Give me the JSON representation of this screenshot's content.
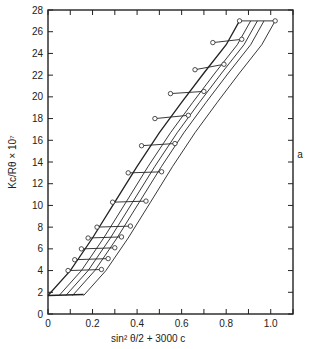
{
  "chart_data": {
    "type": "line",
    "title": "",
    "subtitle": "Zimm plot",
    "xlabel": "sin² θ/2 + 3000 c",
    "ylabel": "Kc/Rθ × 10⁷",
    "xlim": [
      0,
      1.1
    ],
    "ylim": [
      0,
      28
    ],
    "x_ticks": [
      "0",
      "0.2",
      "0.4",
      "0.6",
      "0.8",
      "1.0"
    ],
    "y_ticks": [
      "0",
      "2",
      "4",
      "6",
      "8",
      "10",
      "12",
      "14",
      "16",
      "18",
      "20",
      "22",
      "24",
      "26",
      "28"
    ],
    "grid": false,
    "legend": null,
    "constant_concentration_series": [
      {
        "name": "c=0 (extrapolated)",
        "points": [
          [
            0.0,
            1.7
          ],
          [
            0.1,
            4.0
          ],
          [
            0.2,
            7.0
          ],
          [
            0.3,
            10.3
          ],
          [
            0.4,
            13.6
          ],
          [
            0.5,
            16.7
          ],
          [
            0.6,
            19.5
          ],
          [
            0.7,
            22.2
          ],
          [
            0.8,
            24.8
          ],
          [
            0.86,
            27.0
          ]
        ]
      },
      {
        "name": "c1",
        "points": [
          [
            0.05,
            1.7
          ],
          [
            0.15,
            4.0
          ],
          [
            0.25,
            7.0
          ],
          [
            0.35,
            10.3
          ],
          [
            0.45,
            13.6
          ],
          [
            0.55,
            16.7
          ],
          [
            0.65,
            19.5
          ],
          [
            0.75,
            22.2
          ],
          [
            0.85,
            24.8
          ],
          [
            0.91,
            27.0
          ]
        ]
      },
      {
        "name": "c2",
        "points": [
          [
            0.08,
            1.7
          ],
          [
            0.18,
            4.0
          ],
          [
            0.28,
            7.0
          ],
          [
            0.38,
            10.3
          ],
          [
            0.48,
            13.6
          ],
          [
            0.58,
            16.7
          ],
          [
            0.68,
            19.5
          ],
          [
            0.78,
            22.2
          ],
          [
            0.88,
            24.8
          ],
          [
            0.94,
            27.0
          ]
        ]
      },
      {
        "name": "c3",
        "points": [
          [
            0.11,
            1.7
          ],
          [
            0.21,
            4.0
          ],
          [
            0.31,
            7.0
          ],
          [
            0.41,
            10.3
          ],
          [
            0.51,
            13.6
          ],
          [
            0.61,
            16.7
          ],
          [
            0.71,
            19.5
          ],
          [
            0.81,
            22.2
          ],
          [
            0.91,
            24.8
          ],
          [
            0.97,
            27.0
          ]
        ]
      },
      {
        "name": "c4",
        "points": [
          [
            0.16,
            1.7
          ],
          [
            0.26,
            4.0
          ],
          [
            0.36,
            7.0
          ],
          [
            0.46,
            10.3
          ],
          [
            0.56,
            13.6
          ],
          [
            0.66,
            16.7
          ],
          [
            0.76,
            19.5
          ],
          [
            0.86,
            22.2
          ],
          [
            0.96,
            24.8
          ],
          [
            1.02,
            27.0
          ]
        ]
      }
    ],
    "constant_angle_series": [
      {
        "name": "θ=0 (extrapolated)",
        "points": [
          [
            0.0,
            1.7
          ],
          [
            0.16,
            1.8
          ]
        ]
      },
      {
        "name": "angle rung 1",
        "points": [
          [
            0.09,
            4.0
          ],
          [
            0.24,
            4.1
          ]
        ]
      },
      {
        "name": "angle rung 2",
        "points": [
          [
            0.12,
            5.0
          ],
          [
            0.27,
            5.1
          ]
        ]
      },
      {
        "name": "angle rung 3",
        "points": [
          [
            0.15,
            6.0
          ],
          [
            0.3,
            6.1
          ]
        ]
      },
      {
        "name": "angle rung 4",
        "points": [
          [
            0.18,
            7.0
          ],
          [
            0.33,
            7.1
          ]
        ]
      },
      {
        "name": "angle rung 5",
        "points": [
          [
            0.22,
            8.0
          ],
          [
            0.37,
            8.1
          ]
        ]
      },
      {
        "name": "angle rung 6",
        "points": [
          [
            0.29,
            10.3
          ],
          [
            0.44,
            10.4
          ]
        ]
      },
      {
        "name": "angle rung 7",
        "points": [
          [
            0.36,
            13.0
          ],
          [
            0.51,
            13.1
          ]
        ]
      },
      {
        "name": "angle rung 8",
        "points": [
          [
            0.42,
            15.5
          ],
          [
            0.57,
            15.7
          ]
        ]
      },
      {
        "name": "angle rung 9",
        "points": [
          [
            0.48,
            18.0
          ],
          [
            0.63,
            18.3
          ]
        ]
      },
      {
        "name": "angle rung 10",
        "points": [
          [
            0.55,
            20.3
          ],
          [
            0.7,
            20.5
          ]
        ]
      },
      {
        "name": "angle rung 11",
        "points": [
          [
            0.66,
            22.5
          ],
          [
            0.79,
            23.0
          ]
        ]
      },
      {
        "name": "angle rung 12",
        "points": [
          [
            0.74,
            25.0
          ],
          [
            0.87,
            25.3
          ]
        ]
      },
      {
        "name": "angle rung 13",
        "points": [
          [
            0.86,
            27.0
          ],
          [
            1.02,
            27.0
          ]
        ]
      }
    ],
    "markers": "open circles on data intersections",
    "side_annotation": "a"
  }
}
